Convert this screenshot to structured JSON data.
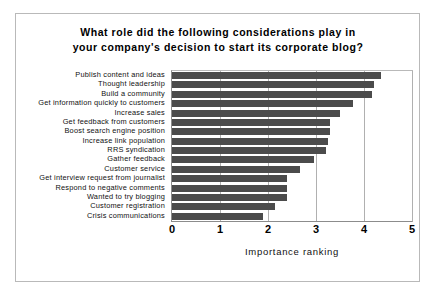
{
  "chart_data": {
    "type": "bar",
    "orientation": "horizontal",
    "title": "What role did the following considerations play in your company's decision to start its corporate blog?",
    "title_lines": [
      "What role did the following considerations play in",
      "your company's decision to start its corporate blog?"
    ],
    "xlabel": "Importance ranking",
    "ylabel": "",
    "xlim": [
      0,
      5
    ],
    "xticks": [
      "0",
      "1",
      "2",
      "3",
      "4",
      "5"
    ],
    "xtick_values": [
      0,
      1,
      2,
      3,
      4,
      5
    ],
    "grid": "vertical",
    "legend": "none",
    "bar_color": "#4b4b4b",
    "categories": [
      "Publish content and ideas",
      "Thought leadership",
      "Build a community",
      "Get information quickly to customers",
      "Increase sales",
      "Get feedback from customers",
      "Boost search engine position",
      "Increase link population",
      "RRS syndication",
      "Gather feedback",
      "Customer service",
      "Get interview request from journalist",
      "Respond to negative comments",
      "Wanted to try blogging",
      "Customer registration",
      "Crisis communications"
    ],
    "values": [
      4.35,
      4.2,
      4.17,
      3.78,
      3.5,
      3.3,
      3.3,
      3.25,
      3.2,
      2.95,
      2.67,
      2.4,
      2.4,
      2.4,
      2.15,
      1.9
    ]
  }
}
